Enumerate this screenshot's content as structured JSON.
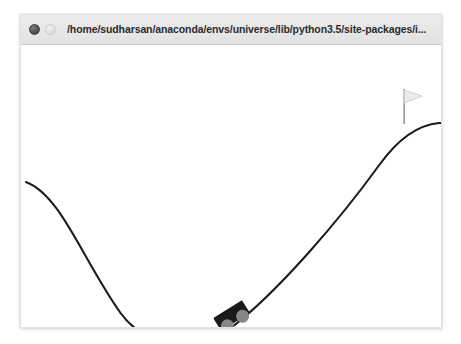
{
  "window": {
    "title": "/home/sudharsan/anaconda/envs/universe/lib/python3.5/site-packages/i...",
    "controls": {
      "close_label": "",
      "minimize_label": ""
    },
    "frame": {
      "x": 20,
      "y": 14,
      "width": 422,
      "height": 314
    }
  },
  "environment": {
    "name": "MountainCar-v0",
    "background_color": "#ffffff",
    "track_color": "#1c1c1c",
    "car_body_color": "#1a1a1a",
    "car_wheel_color": "#878787",
    "flag_banner_color": "#ebebeb",
    "flag_pole_color": "#9a9a9a",
    "track_path": "M 5,137 C 40,150 62,215 100,268 C 128,306 180,306 212,282 C 258,247 320,175 360,120 C 378,95 398,80 420,78 L 422,78",
    "car": {
      "position_x": 215,
      "position_y": 276,
      "rotation_deg": -32,
      "body_width": 33,
      "body_height": 17,
      "wheel_radius": 6.5
    },
    "flag": {
      "pole_x": 385,
      "pole_top_y": 44,
      "pole_bottom_y": 79,
      "banner_width": 17,
      "banner_height": 13
    }
  }
}
